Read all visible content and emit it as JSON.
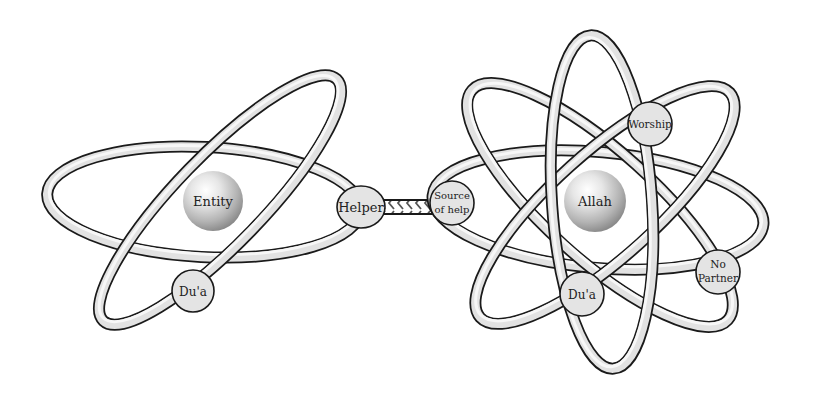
{
  "diagram": {
    "type": "atom-model-comparison",
    "left_atom": {
      "nucleus": {
        "label": "Entity"
      },
      "orbits": 2,
      "nodes": [
        {
          "id": "helper",
          "label": "Helper"
        },
        {
          "id": "dua-left",
          "label": "Du'a"
        }
      ]
    },
    "connector": {
      "from": "Source of help",
      "to": "Helper",
      "style": "chevron-arrows",
      "direction": "right-to-left"
    },
    "right_atom": {
      "nucleus": {
        "label": "Allah"
      },
      "orbits": 4,
      "nodes": [
        {
          "id": "source-of-help",
          "label_line1": "Source",
          "label_line2": "of help"
        },
        {
          "id": "worship",
          "label": "Worship"
        },
        {
          "id": "dua-right",
          "label": "Du'a"
        },
        {
          "id": "no-partner",
          "label_line1": "No",
          "label_line2": "Partner"
        }
      ]
    },
    "colors": {
      "ring_outline": "#1a1a1a",
      "ring_fill": "#e2e2e2",
      "bubble_fill": "#e4e4e4",
      "sphere_highlight": "#ffffff",
      "sphere_shadow": "#8a8a8a",
      "background": "#ffffff"
    }
  }
}
